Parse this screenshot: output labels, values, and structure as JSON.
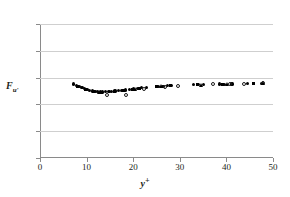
{
  "chart_data": {
    "type": "scatter",
    "title": "",
    "xlabel": "y+",
    "xlabel_base": "y",
    "xlabel_sup": "+",
    "ylabel_base": "F",
    "ylabel_sub": "u'",
    "xlim": [
      0,
      50
    ],
    "ylim": [
      0,
      5
    ],
    "xticks": [
      0,
      10,
      20,
      30,
      40,
      50
    ],
    "yticks": [
      0,
      1,
      2,
      3,
      4,
      5
    ],
    "grid": "horizontal",
    "legend": "none",
    "series": [
      {
        "name": "filled-circle",
        "marker": "filled-circle",
        "color": "#000000",
        "points": [
          [
            7.2,
            2.76
          ],
          [
            7.8,
            2.7
          ],
          [
            8.4,
            2.66
          ],
          [
            9.0,
            2.62
          ],
          [
            9.5,
            2.58
          ],
          [
            10.1,
            2.55
          ],
          [
            10.6,
            2.52
          ],
          [
            11.2,
            2.5
          ],
          [
            11.8,
            2.48
          ],
          [
            12.3,
            2.47
          ],
          [
            12.9,
            2.46
          ],
          [
            13.5,
            2.46
          ],
          [
            14.1,
            2.47
          ],
          [
            14.8,
            2.48
          ],
          [
            15.4,
            2.49
          ],
          [
            16.1,
            2.5
          ],
          [
            16.8,
            2.52
          ],
          [
            17.6,
            2.53
          ],
          [
            18.4,
            2.54
          ],
          [
            19.2,
            2.56
          ],
          [
            20.0,
            2.58
          ],
          [
            20.9,
            2.6
          ],
          [
            21.8,
            2.62
          ],
          [
            22.8,
            2.63
          ],
          [
            25.5,
            2.66
          ],
          [
            26.4,
            2.68
          ],
          [
            27.3,
            2.69
          ],
          [
            28.2,
            2.7
          ],
          [
            33.0,
            2.73
          ],
          [
            34.0,
            2.74
          ],
          [
            35.0,
            2.73
          ],
          [
            38.6,
            2.76
          ],
          [
            39.6,
            2.75
          ],
          [
            41.2,
            2.76
          ],
          [
            44.6,
            2.78
          ],
          [
            47.6,
            2.79
          ]
        ]
      },
      {
        "name": "open-circle",
        "marker": "open-circle",
        "color": "#1a1a1a",
        "points": [
          [
            14.3,
            2.34
          ],
          [
            18.5,
            2.36
          ],
          [
            22.3,
            2.58
          ],
          [
            26.8,
            2.66
          ],
          [
            29.6,
            2.7
          ],
          [
            37.2,
            2.76
          ],
          [
            40.8,
            2.76
          ],
          [
            43.8,
            2.77
          ],
          [
            47.8,
            2.8
          ]
        ]
      },
      {
        "name": "filled-square",
        "marker": "filled-square",
        "color": "#000000",
        "points": [
          [
            8.1,
            2.68
          ],
          [
            9.8,
            2.57
          ],
          [
            11.5,
            2.49
          ],
          [
            13.2,
            2.46
          ],
          [
            15.9,
            2.5
          ],
          [
            17.9,
            2.53
          ],
          [
            19.9,
            2.57
          ],
          [
            21.4,
            2.61
          ],
          [
            24.9,
            2.65
          ],
          [
            27.9,
            2.69
          ],
          [
            33.8,
            2.74
          ],
          [
            39.2,
            2.76
          ],
          [
            45.8,
            2.78
          ]
        ]
      },
      {
        "name": "filled-triangle",
        "marker": "filled-triangle",
        "color": "#000000",
        "points": [
          [
            12.6,
            2.47
          ],
          [
            20.5,
            2.59
          ],
          [
            26.0,
            2.67
          ],
          [
            34.6,
            2.74
          ],
          [
            40.1,
            2.76
          ],
          [
            47.9,
            2.79
          ]
        ]
      }
    ]
  }
}
